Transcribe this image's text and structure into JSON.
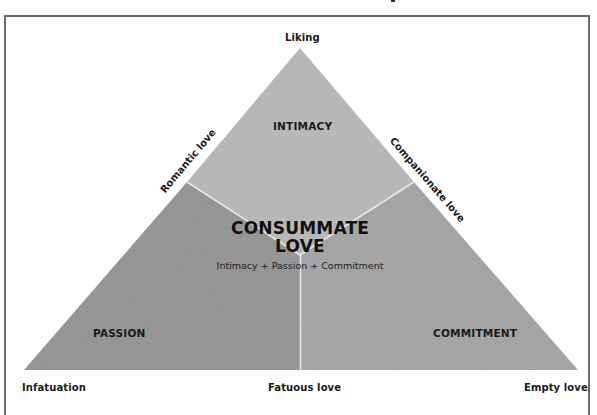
{
  "diagram": {
    "vertices": {
      "top": "Liking",
      "bottom_left": "Infatuation",
      "bottom_right": "Empty love"
    },
    "edges": {
      "left": "Romantic love",
      "right": "Companionate love",
      "bottom": "Fatuous love"
    },
    "regions": {
      "top": "INTIMACY",
      "left": "PASSION",
      "right": "COMMITMENT"
    },
    "center": {
      "title_line1": "CONSUMMATE",
      "title_line2": "LOVE",
      "subtitle": "Intimacy + Passion + Commitment"
    },
    "colors": {
      "intimacy": "#bcbcbc",
      "passion": "#9a9a9a",
      "commitment": "#a9a9a9",
      "divider": "#e8e8e8",
      "frame": "#6a6a6a"
    }
  }
}
